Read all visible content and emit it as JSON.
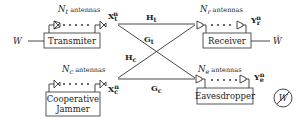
{
  "diagram": {
    "nodes": {
      "transmitter": {
        "label": "Transmiter",
        "antennas_label_sym": "N",
        "antennas_label_sub": "t",
        "antennas_label_text": " antennas",
        "signal_sym": "X",
        "signal_sub": "t",
        "signal_sup": "n",
        "input": "W"
      },
      "receiver": {
        "label": "Receiver",
        "antennas_label_sym": "N",
        "antennas_label_sub": "r",
        "antennas_label_text": " antennas",
        "signal_sym": "Y",
        "signal_sub": "r",
        "signal_sup": "n",
        "output": "Ŵ"
      },
      "jammer": {
        "label_line1": "Cooperative",
        "label_line2": "Jammer",
        "antennas_label_sym": "N",
        "antennas_label_sub": "c",
        "antennas_label_text": " antennas",
        "signal_sym": "X",
        "signal_sub": "c",
        "signal_sup": "n"
      },
      "eavesdropper": {
        "label": "Eavesdropper",
        "antennas_label_sym": "N",
        "antennas_label_sub": "e",
        "antennas_label_text": " antennas",
        "signal_sym": "Y",
        "signal_sub": "e",
        "signal_sup": "n",
        "blocked_symbol": "W"
      }
    },
    "channels": [
      {
        "from": "transmitter",
        "to": "receiver",
        "sym": "H",
        "sub": "t"
      },
      {
        "from": "transmitter",
        "to": "eavesdropper",
        "sym": "G",
        "sub": "t"
      },
      {
        "from": "jammer",
        "to": "receiver",
        "sym": "H",
        "sub": "c"
      },
      {
        "from": "jammer",
        "to": "eavesdropper",
        "sym": "G",
        "sub": "c"
      }
    ]
  }
}
